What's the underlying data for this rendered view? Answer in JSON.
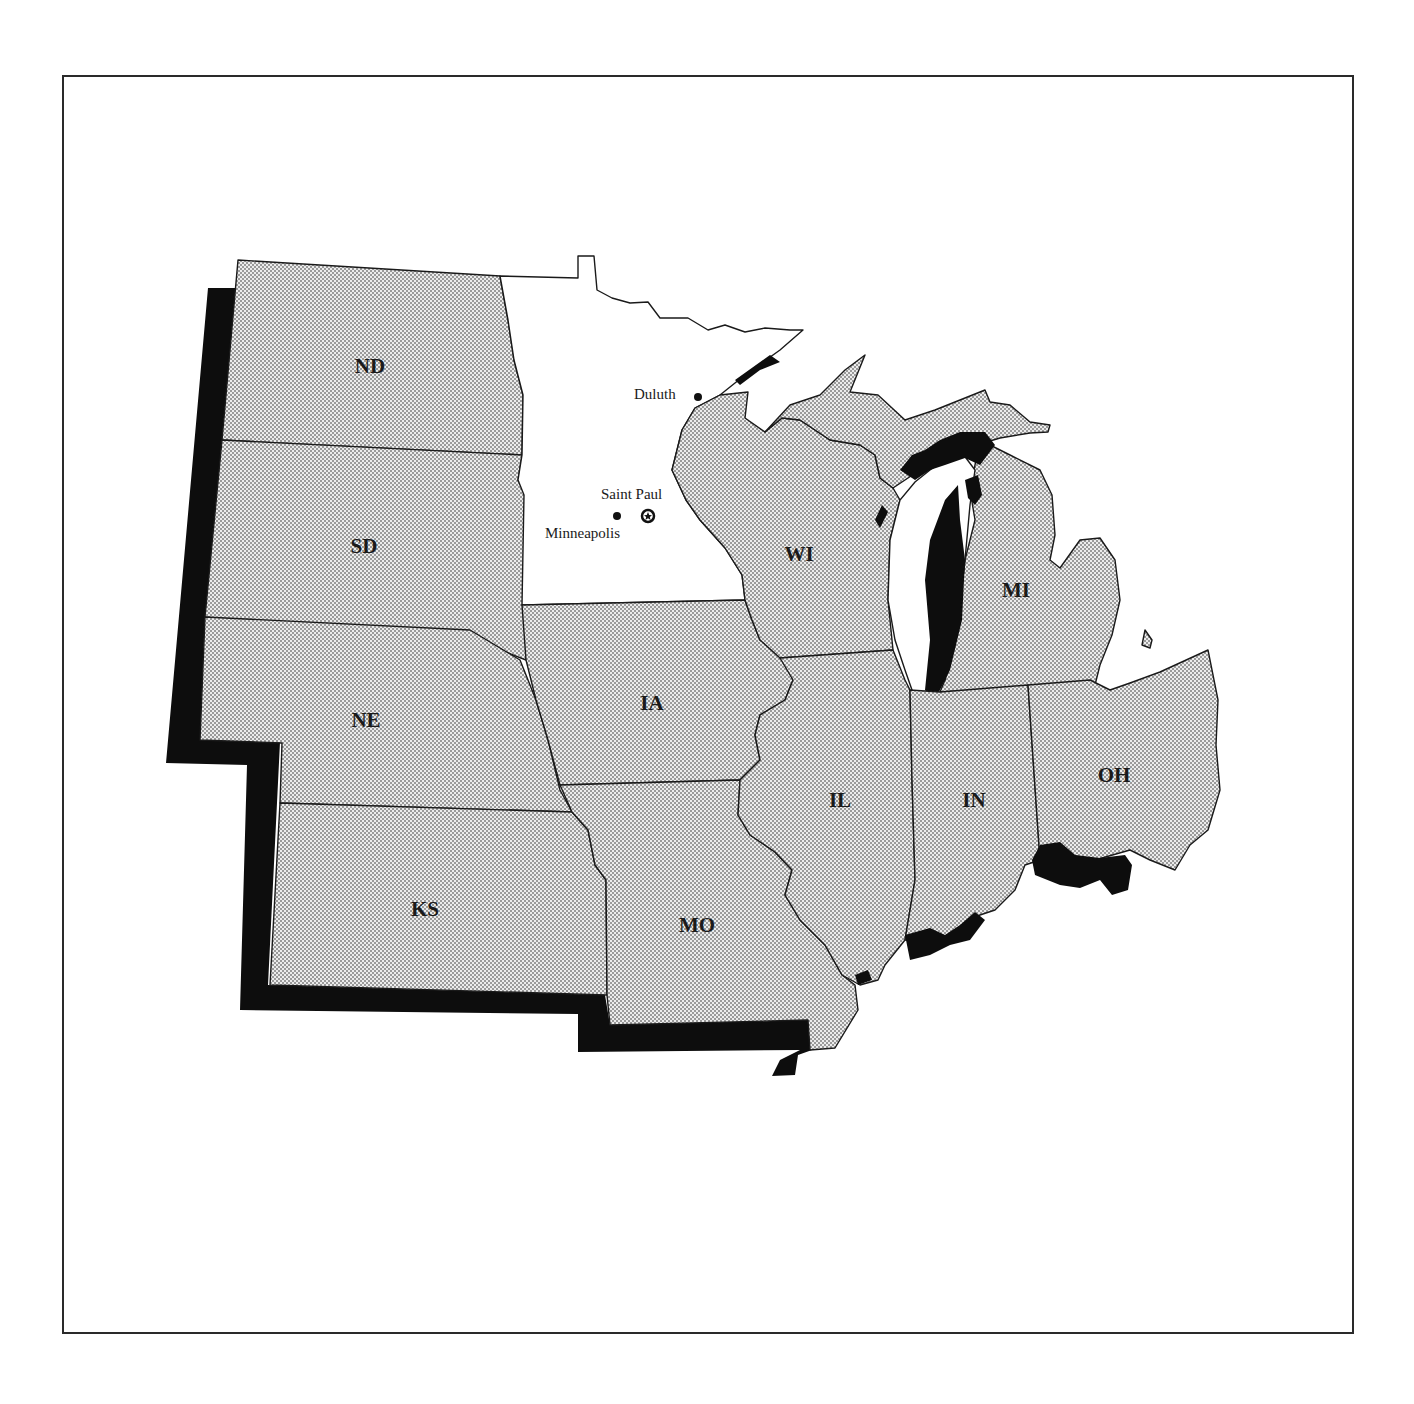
{
  "map": {
    "region": "Midwest United States",
    "highlighted_state": "MN",
    "colors": {
      "stipple_fill": "#d6d6d6",
      "highlight_fill": "#ffffff",
      "shadow_and_lakes": "#0d0d0d",
      "border": "#1a1a1a"
    },
    "states": [
      {
        "abbr": "ND",
        "label": "ND"
      },
      {
        "abbr": "SD",
        "label": "SD"
      },
      {
        "abbr": "NE",
        "label": "NE"
      },
      {
        "abbr": "KS",
        "label": "KS"
      },
      {
        "abbr": "MN",
        "label": ""
      },
      {
        "abbr": "IA",
        "label": "IA"
      },
      {
        "abbr": "MO",
        "label": "MO"
      },
      {
        "abbr": "WI",
        "label": "WI"
      },
      {
        "abbr": "IL",
        "label": "IL"
      },
      {
        "abbr": "MI",
        "label": "MI"
      },
      {
        "abbr": "IN",
        "label": "IN"
      },
      {
        "abbr": "OH",
        "label": "OH"
      }
    ],
    "cities": [
      {
        "name": "Duluth",
        "marker": "dot"
      },
      {
        "name": "Saint Paul",
        "marker": "star-in-circle (capital)"
      },
      {
        "name": "Minneapolis",
        "marker": "dot"
      }
    ]
  }
}
